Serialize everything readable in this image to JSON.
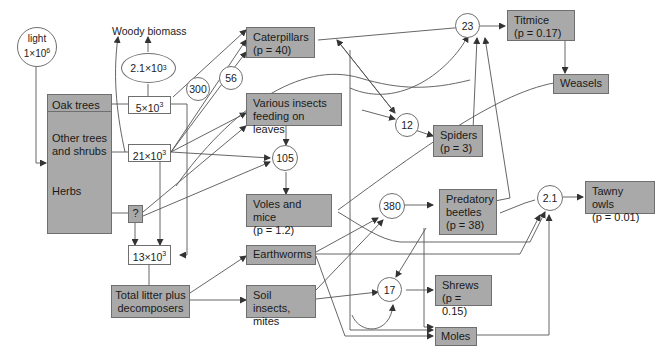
{
  "figure": {
    "sources": {
      "light": {
        "label": "light",
        "value": "1×10",
        "exp": "6"
      },
      "woody_biomass": "Woody biomass"
    },
    "producers": {
      "oak_trees": "Oak trees",
      "other_trees": "Other trees and shrubs",
      "herbs": "Herbs",
      "herbs_flow": "?"
    },
    "flows": {
      "oak_flow": {
        "value": "5×10",
        "exp": "3"
      },
      "other_flow": {
        "value": "21×10",
        "exp": "3"
      },
      "litter_flow": {
        "value": "13×10",
        "exp": "3"
      },
      "woody_ellipse": {
        "value": "2.1×10",
        "exp": "3"
      },
      "c300": "300",
      "c56": "56",
      "c105": "105",
      "c12": "12",
      "c23": "23",
      "c380": "380",
      "c17": "17",
      "c2_1": "2.1"
    },
    "consumers": {
      "caterpillars": {
        "name": "Caterpillars",
        "p": "(p = 40)"
      },
      "various_insects": {
        "name": "Various insects feeding on leaves"
      },
      "voles_mice": {
        "name": "Voles and mice",
        "p": "(p = 1.2)"
      },
      "earthworms": {
        "name": "Earthworms"
      },
      "soil_insects": {
        "name": "Soil insects, mites"
      },
      "total_litter": {
        "name": "Total litter plus decomposers"
      },
      "titmice": {
        "name": "Titmice",
        "p": "(p = 0.17)"
      },
      "weasels": {
        "name": "Weasels"
      },
      "spiders": {
        "name": "Spiders",
        "p": "(p = 3)"
      },
      "predatory_beetles": {
        "name": "Predatory beetles",
        "p": "(p = 38)"
      },
      "tawny_owls": {
        "name": "Tawny owls",
        "p": "(p = 0.01)"
      },
      "shrews": {
        "name": "Shrews",
        "p": "(p = 0.15)"
      },
      "moles": {
        "name": "Moles"
      }
    },
    "colors": {
      "box_fill": "#a9a9a9",
      "line": "#555555",
      "background": "#ffffff"
    }
  }
}
